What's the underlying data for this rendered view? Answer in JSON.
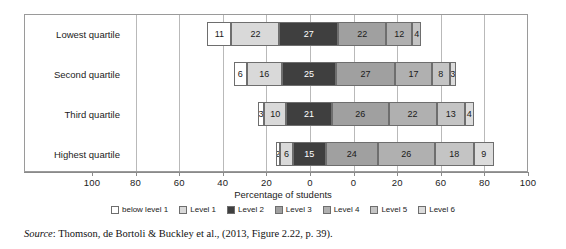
{
  "chart_data": {
    "type": "bar",
    "subtype": "diverging-stacked-bar",
    "orientation": "horizontal",
    "title": "",
    "xlabel": "Percentage of students",
    "ylabel": "",
    "categories": [
      "Lowest quartile",
      "Second quartile",
      "Third quartile",
      "Highest quartile"
    ],
    "series": [
      {
        "name": "below level 1",
        "color": "#ffffff",
        "values": [
          11,
          6,
          3,
          2
        ]
      },
      {
        "name": "Level 1",
        "color": "#d9d9d9",
        "values": [
          22,
          16,
          10,
          6
        ]
      },
      {
        "name": "Level 2",
        "color": "#3f3f3f",
        "values": [
          27,
          25,
          21,
          15
        ]
      },
      {
        "name": "Level 3",
        "color": "#a0a0a0",
        "values": [
          22,
          27,
          26,
          24
        ]
      },
      {
        "name": "Level 4",
        "color": "#b0b0b0",
        "values": [
          12,
          17,
          22,
          26
        ]
      },
      {
        "name": "Level 5",
        "color": "#c4c4c4",
        "values": [
          4,
          8,
          13,
          18
        ]
      },
      {
        "name": "Level 6",
        "color": "#dcdcdc",
        "values": [
          0,
          3,
          4,
          9
        ]
      }
    ],
    "xticks": [
      "100",
      "80",
      "60",
      "40",
      "20",
      "0",
      "0",
      "20",
      "60",
      "80",
      "100"
    ],
    "xlim": [
      -110,
      110
    ],
    "grid": true,
    "legend_position": "bottom",
    "legend_entries": [
      "below level 1",
      "Level 1",
      "Level 2",
      "Level 3",
      "Level 4",
      "Level 5",
      "Level 6"
    ],
    "note": "Bars diverge about a zero line that falls inside the Level 2 segment; labels show percentage of students at each proficiency level."
  },
  "axis": {
    "title": "Percentage of students",
    "ticks": [
      {
        "label": "100"
      },
      {
        "label": "80"
      },
      {
        "label": "60"
      },
      {
        "label": "40"
      },
      {
        "label": "20"
      },
      {
        "label": "0"
      },
      {
        "label": "0"
      },
      {
        "label": "20"
      },
      {
        "label": "60"
      },
      {
        "label": "80"
      },
      {
        "label": "100"
      }
    ]
  },
  "rows": [
    {
      "category": "Lowest quartile",
      "segments": [
        {
          "series": "below level 1",
          "label": "11"
        },
        {
          "series": "Level 1",
          "label": "22"
        },
        {
          "series": "Level 2",
          "label": "27"
        },
        {
          "series": "Level 3",
          "label": "22"
        },
        {
          "series": "Level 4",
          "label": "12"
        },
        {
          "series": "Level 5",
          "label": "4"
        }
      ]
    },
    {
      "category": "Second quartile",
      "segments": [
        {
          "series": "below level 1",
          "label": "6"
        },
        {
          "series": "Level 1",
          "label": "16"
        },
        {
          "series": "Level 2",
          "label": "25"
        },
        {
          "series": "Level 3",
          "label": "27"
        },
        {
          "series": "Level 4",
          "label": "17"
        },
        {
          "series": "Level 5",
          "label": "8"
        },
        {
          "series": "Level 6",
          "label": "3"
        }
      ]
    },
    {
      "category": "Third quartile",
      "segments": [
        {
          "series": "below level 1",
          "label": "3"
        },
        {
          "series": "Level 1",
          "label": "10"
        },
        {
          "series": "Level 2",
          "label": "21"
        },
        {
          "series": "Level 3",
          "label": "26"
        },
        {
          "series": "Level 4",
          "label": "22"
        },
        {
          "series": "Level 5",
          "label": "13"
        },
        {
          "series": "Level 6",
          "label": "4"
        }
      ]
    },
    {
      "category": "Highest quartile",
      "segments": [
        {
          "series": "below level 1",
          "label": "2"
        },
        {
          "series": "Level 1",
          "label": "6"
        },
        {
          "series": "Level 2",
          "label": "15"
        },
        {
          "series": "Level 3",
          "label": "24"
        },
        {
          "series": "Level 4",
          "label": "26"
        },
        {
          "series": "Level 5",
          "label": "18"
        },
        {
          "series": "Level 6",
          "label": "9"
        }
      ]
    }
  ],
  "source": {
    "prefix": "Source",
    "text": ": Thomson, de Bortoli & Buckley et al., (2013, Figure 2.22, p. 39)."
  }
}
